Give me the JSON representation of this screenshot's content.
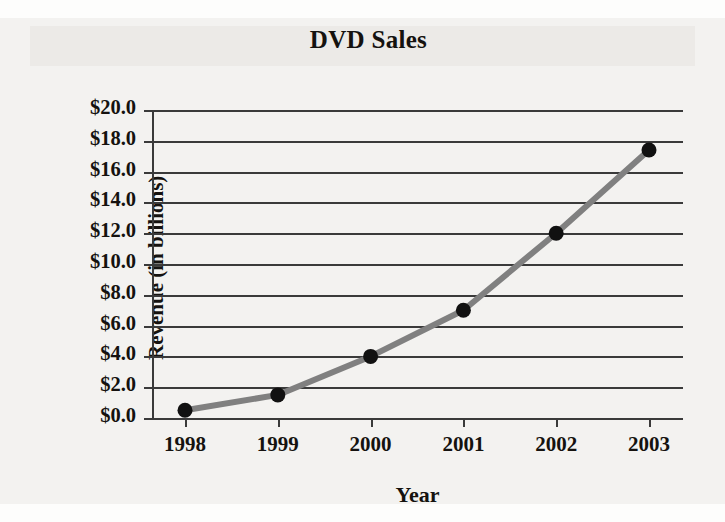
{
  "figure": {
    "background_color": "#f3f2f0",
    "axis_color": "#3a3a3a",
    "line_color": "#808080",
    "marker_color": "#111111"
  },
  "chart_data": {
    "type": "line",
    "title": "DVD Sales",
    "xlabel": "Year",
    "ylabel": "Revenue (in billions)",
    "categories": [
      "1998",
      "1999",
      "2000",
      "2001",
      "2002",
      "2003"
    ],
    "values": [
      0.5,
      1.5,
      4.0,
      7.0,
      12.0,
      17.4
    ],
    "ylim": [
      0,
      20
    ],
    "ytick_step": 2,
    "ytick_labels": [
      "$20.0",
      "$18.0",
      "$16.0",
      "$14.0",
      "$12.0",
      "$10.0",
      "$8.0",
      "$6.0",
      "$4.0",
      "$2.0",
      "$0.0"
    ],
    "ytick_values": [
      20,
      18,
      16,
      14,
      12,
      10,
      8,
      6,
      4,
      2,
      0
    ],
    "grid": true,
    "grid_axis": "y",
    "legend": false,
    "marker": "circle",
    "value_unit": "billions of dollars"
  }
}
